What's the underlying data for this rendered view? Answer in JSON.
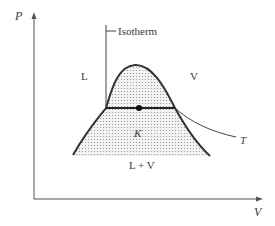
{
  "diagram": {
    "type": "P-V phase diagram",
    "axes": {
      "y_label": "P",
      "x_label": "V"
    },
    "labels": {
      "isotherm": "Isotherm",
      "liquid": "L",
      "vapor": "V",
      "critical_point": "K",
      "two_phase": "L + V",
      "temperature": "T"
    },
    "colors": {
      "line": "#333333",
      "fill_dots": "#9a9a9a",
      "text": "#3a3a3a"
    }
  }
}
